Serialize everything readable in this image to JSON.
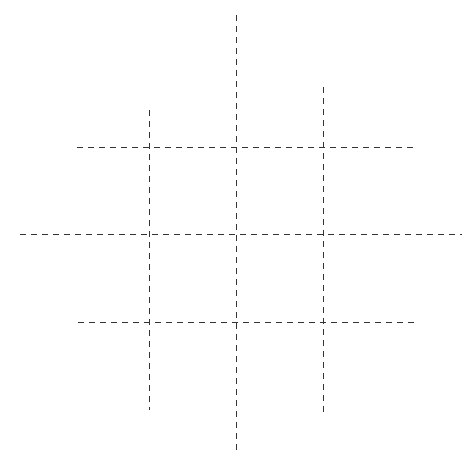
{
  "diagram": {
    "type": "grid-of-dashed-lines",
    "stroke_color": "#333333",
    "background": "#ffffff",
    "vertical_lines": [
      {
        "x": 149,
        "y1": 110,
        "y2": 410
      },
      {
        "x": 236,
        "y1": 15,
        "y2": 452
      },
      {
        "x": 323,
        "y1": 87,
        "y2": 415
      }
    ],
    "horizontal_lines": [
      {
        "y": 147,
        "x1": 77,
        "x2": 417
      },
      {
        "y": 234,
        "x1": 20,
        "x2": 462
      },
      {
        "y": 322,
        "x1": 78,
        "x2": 417
      }
    ],
    "caption": ""
  }
}
